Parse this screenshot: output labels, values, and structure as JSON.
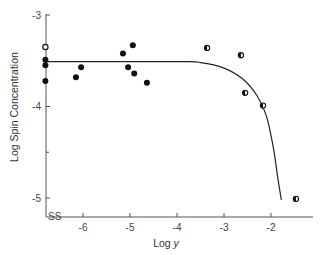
{
  "chart_data": {
    "type": "scatter",
    "title": "",
    "xlabel": "Log y",
    "ylabel": "Log Spin Concentration",
    "xlim": [
      -6.8,
      -1.1
    ],
    "ylim": [
      -5.2,
      -3.0
    ],
    "x_ticks": [
      -6,
      -5,
      -4,
      -3,
      -2
    ],
    "x_tick_labels": [
      "-6",
      "-5",
      "-4",
      "-3",
      "-2"
    ],
    "y_ticks": [
      -3,
      -4,
      -5
    ],
    "y_tick_labels": [
      "-3",
      "-4",
      "-5"
    ],
    "y_minor_ticks": [
      -4.5
    ],
    "axis_break": "x-axis break mark near origin (SS)",
    "grid": false,
    "legend": null,
    "series": [
      {
        "name": "open",
        "marker": "open-circle",
        "points": [
          {
            "x": -6.8,
            "y": -3.35
          }
        ]
      },
      {
        "name": "filled",
        "marker": "filled-circle",
        "points": [
          {
            "x": -6.8,
            "y": -3.49
          },
          {
            "x": -6.8,
            "y": -3.55
          },
          {
            "x": -6.8,
            "y": -3.72
          },
          {
            "x": -6.04,
            "y": -3.57
          },
          {
            "x": -6.15,
            "y": -3.68
          },
          {
            "x": -4.94,
            "y": -3.33
          },
          {
            "x": -5.15,
            "y": -3.42
          },
          {
            "x": -5.04,
            "y": -3.57
          },
          {
            "x": -4.91,
            "y": -3.64
          },
          {
            "x": -4.64,
            "y": -3.74
          }
        ]
      },
      {
        "name": "half-filled",
        "marker": "half-filled-circle",
        "points": [
          {
            "x": -3.36,
            "y": -3.36
          },
          {
            "x": -2.64,
            "y": -3.44
          },
          {
            "x": -2.55,
            "y": -3.85
          },
          {
            "x": -2.17,
            "y": -3.99
          },
          {
            "x": -1.47,
            "y": -5.01
          }
        ]
      }
    ],
    "fit_curve": {
      "name": "theoretical curve",
      "type": "line",
      "points": [
        {
          "x": -6.8,
          "y": -3.51
        },
        {
          "x": -4.0,
          "y": -3.51
        },
        {
          "x": -3.5,
          "y": -3.52
        },
        {
          "x": -3.0,
          "y": -3.58
        },
        {
          "x": -2.6,
          "y": -3.7
        },
        {
          "x": -2.3,
          "y": -3.88
        },
        {
          "x": -2.1,
          "y": -4.1
        },
        {
          "x": -1.95,
          "y": -4.45
        },
        {
          "x": -1.85,
          "y": -4.8
        },
        {
          "x": -1.78,
          "y": -5.02
        }
      ]
    }
  },
  "axes": {
    "xlabel_main": "Log ",
    "xlabel_var": "y",
    "ylabel": "Log Spin Concentration",
    "break_mark": "SS"
  }
}
